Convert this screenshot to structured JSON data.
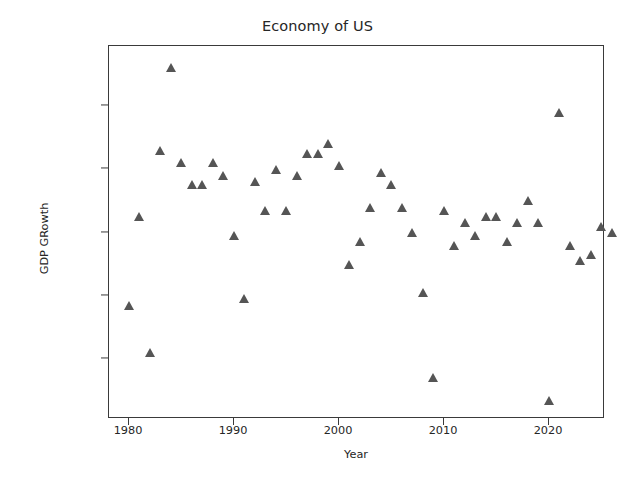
{
  "chart_data": {
    "type": "scatter",
    "title": "Economy of US",
    "xlabel": "Year",
    "ylabel": "GDP GRowth",
    "marker": "triangle-up",
    "marker_color": "#555555",
    "grid": false,
    "legend": null,
    "xlim": [
      1978.1,
      1325.0
    ],
    "ylim": [
      -0.0385,
      0.0785
    ],
    "xticks": [
      1980,
      1990,
      2000,
      2010,
      2020
    ],
    "xtick_labels": [
      "1980",
      "1990",
      "2000",
      "2010",
      "2020"
    ],
    "yticks": [
      -0.02,
      0.0,
      0.02,
      0.04,
      0.06
    ],
    "ytick_labels": [
      "−0.02",
      "0.00",
      "0.02",
      "0.04",
      "0.06"
    ],
    "x": [
      1980,
      1981,
      1982,
      1983,
      1984,
      1985,
      1986,
      1987,
      1988,
      1989,
      1990,
      1991,
      1992,
      1993,
      1994,
      1995,
      1996,
      1997,
      1998,
      1999,
      2000,
      2001,
      2002,
      2003,
      2004,
      2005,
      2006,
      2007,
      2008,
      2009,
      2010,
      2011,
      2012,
      2013,
      2014,
      2015,
      2016,
      2017,
      2018,
      2019,
      2020,
      2021,
      2022,
      2023,
      2024,
      2025,
      2026
    ],
    "y": [
      -0.003,
      0.025,
      -0.018,
      0.046,
      0.072,
      0.042,
      0.035,
      0.035,
      0.042,
      0.038,
      0.019,
      -0.001,
      0.036,
      0.027,
      0.04,
      0.027,
      0.038,
      0.045,
      0.045,
      0.048,
      0.041,
      0.01,
      0.017,
      0.028,
      0.039,
      0.035,
      0.028,
      0.02,
      0.001,
      -0.026,
      0.027,
      0.016,
      0.023,
      0.019,
      0.025,
      0.025,
      0.017,
      0.023,
      0.03,
      0.023,
      -0.033,
      0.058,
      0.016,
      0.011,
      0.013,
      0.022,
      0.02
    ],
    "points": [
      {
        "year": 1980,
        "value": -0.003
      },
      {
        "year": 1981,
        "value": 0.025
      },
      {
        "year": 1982,
        "value": -0.018
      },
      {
        "year": 1983,
        "value": 0.046
      },
      {
        "year": 1984,
        "value": 0.072
      },
      {
        "year": 1985,
        "value": 0.042
      },
      {
        "year": 1986,
        "value": 0.035
      },
      {
        "year": 1987,
        "value": 0.035
      },
      {
        "year": 1988,
        "value": 0.042
      },
      {
        "year": 1989,
        "value": 0.038
      },
      {
        "year": 1990,
        "value": 0.019
      },
      {
        "year": 1991,
        "value": -0.001
      },
      {
        "year": 1992,
        "value": 0.036
      },
      {
        "year": 1993,
        "value": 0.027
      },
      {
        "year": 1994,
        "value": 0.04
      },
      {
        "year": 1995,
        "value": 0.027
      },
      {
        "year": 1996,
        "value": 0.038
      },
      {
        "year": 1997,
        "value": 0.045
      },
      {
        "year": 1998,
        "value": 0.045
      },
      {
        "year": 1999,
        "value": 0.048
      },
      {
        "year": 2000,
        "value": 0.041
      },
      {
        "year": 2001,
        "value": 0.01
      },
      {
        "year": 2002,
        "value": 0.017
      },
      {
        "year": 2003,
        "value": 0.028
      },
      {
        "year": 2004,
        "value": 0.039
      },
      {
        "year": 2005,
        "value": 0.035
      },
      {
        "year": 2006,
        "value": 0.028
      },
      {
        "year": 2007,
        "value": 0.02
      },
      {
        "year": 2008,
        "value": 0.001
      },
      {
        "year": 2009,
        "value": -0.026
      },
      {
        "year": 2010,
        "value": 0.027
      },
      {
        "year": 2011,
        "value": 0.016
      },
      {
        "year": 2012,
        "value": 0.023
      },
      {
        "year": 2013,
        "value": 0.019
      },
      {
        "year": 2014,
        "value": 0.025
      },
      {
        "year": 2015,
        "value": 0.025
      },
      {
        "year": 2016,
        "value": 0.017
      },
      {
        "year": 2017,
        "value": 0.023
      },
      {
        "year": 2018,
        "value": 0.03
      },
      {
        "year": 2019,
        "value": 0.023
      },
      {
        "year": 2020,
        "value": -0.033
      },
      {
        "year": 2021,
        "value": 0.058
      },
      {
        "year": 2022,
        "value": 0.016
      },
      {
        "year": 2023,
        "value": 0.011
      },
      {
        "year": 2024,
        "value": 0.013
      },
      {
        "year": 2025,
        "value": 0.022
      },
      {
        "year": 2026,
        "value": 0.02
      }
    ]
  }
}
